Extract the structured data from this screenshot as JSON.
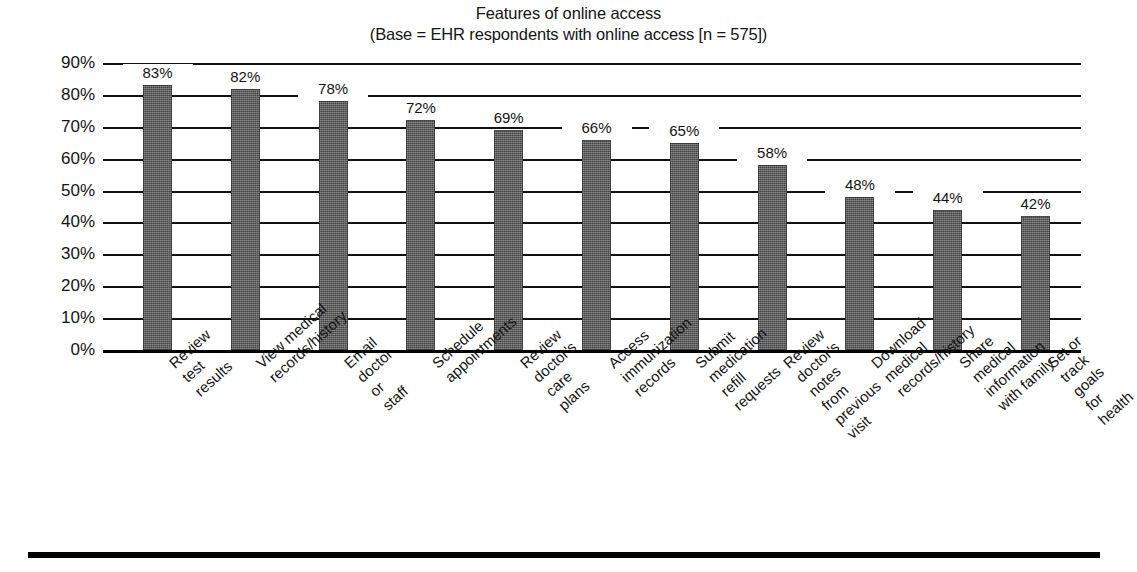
{
  "chart_data": {
    "type": "bar",
    "title": "Features of online access",
    "subtitle": "(Base = EHR respondents with online access [n = 575])",
    "xlabel": "",
    "ylabel": "",
    "ylim": [
      0,
      90
    ],
    "ytick_labels": [
      "90%",
      "80%",
      "70%",
      "60%",
      "50%",
      "40%",
      "30%",
      "20%",
      "10%",
      "0%"
    ],
    "ytick_values": [
      90,
      80,
      70,
      60,
      50,
      40,
      30,
      20,
      10,
      0
    ],
    "grid": true,
    "legend": "none",
    "bar_color": "#6a6a6a",
    "categories": [
      "Review test\nresults",
      "View medical\nrecords/history",
      "Email doctor or staff",
      "Schedule appointments",
      "Review doctor's\ncare plans",
      "Access immunization\nrecords",
      "Submit medication\nrefill requests",
      "Review doctor's notes\nfrom previous visit",
      "Download medical\nrecords/history",
      "Share medical information\nwith family",
      "Set or track goals\nfor health"
    ],
    "values": [
      83,
      82,
      78,
      72,
      69,
      66,
      65,
      58,
      48,
      44,
      42
    ],
    "value_labels": [
      "83%",
      "82%",
      "78%",
      "72%",
      "69%",
      "66%",
      "65%",
      "58%",
      "48%",
      "44%",
      "42%"
    ]
  }
}
